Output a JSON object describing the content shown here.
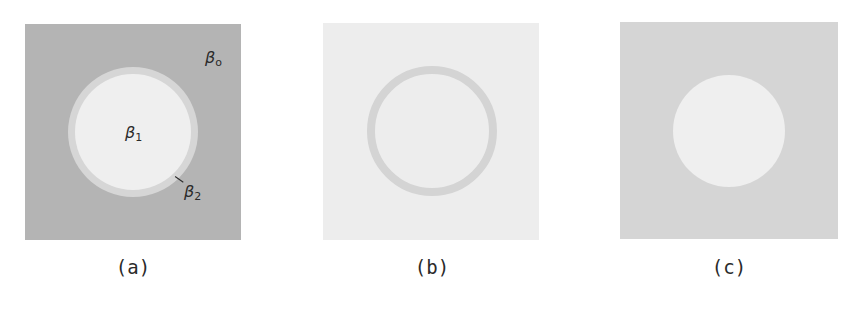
{
  "figure": {
    "panels": [
      {
        "id": "a",
        "caption": "(a)",
        "box": {
          "x": 25,
          "y": 24,
          "w": 216,
          "h": 216,
          "color": "#b4b4b4"
        },
        "ring": {
          "cx": 133,
          "cy": 132,
          "r_outer": 65,
          "r_inner": 58,
          "color": "#d6d6d6"
        },
        "disc": {
          "cx": 133,
          "cy": 132,
          "r": 58,
          "color": "#efefef"
        },
        "labels": {
          "beta_o": {
            "symbol": "β",
            "subscript": "o"
          },
          "beta_1": {
            "symbol": "β",
            "subscript": "1"
          },
          "beta_2": {
            "symbol": "β",
            "subscript": "2"
          }
        }
      },
      {
        "id": "b",
        "caption": "(b)",
        "box": {
          "x": 323,
          "y": 23,
          "w": 216,
          "h": 217,
          "color": "#ededed"
        },
        "ring": {
          "cx": 432,
          "cy": 131,
          "r_outer": 65,
          "thickness": 8,
          "color": "#d4d4d4"
        }
      },
      {
        "id": "c",
        "caption": "(c)",
        "box": {
          "x": 620,
          "y": 22,
          "w": 218,
          "h": 217,
          "color": "#d5d5d5"
        },
        "disc": {
          "cx": 729,
          "cy": 131,
          "r": 56,
          "color": "#efefef"
        }
      }
    ]
  }
}
